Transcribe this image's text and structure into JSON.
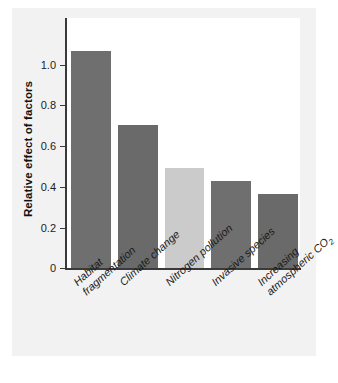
{
  "chart_data": {
    "type": "bar",
    "title": "",
    "xlabel": "",
    "ylabel": "Relative effect of factors",
    "categories": [
      "Habitat fragmentation",
      "Climate change",
      "Nitrogen pollution",
      "Invasive species",
      "Increasing atmospheric CO2"
    ],
    "values": [
      1.0,
      0.66,
      0.46,
      0.4,
      0.34
    ],
    "ylim": [
      0,
      1.15
    ],
    "yticks": [
      0,
      0.2,
      0.4,
      0.6,
      0.8,
      1.0
    ],
    "ytick_labels": [
      "0",
      "0.2",
      "0.4",
      "0.6",
      "0.8",
      "1.0"
    ],
    "grid": false,
    "legend": "none",
    "bar_colors": [
      "#6f6f6f",
      "#6a6a6a",
      "#cbcbcb",
      "#6f6f6f",
      "#6a6a6a"
    ]
  },
  "axes": {
    "y_title": "Relative effect of factors",
    "ticks": [
      {
        "label": "1.0",
        "value": 1.0
      },
      {
        "label": "0.8",
        "value": 0.8
      },
      {
        "label": "0.6",
        "value": 0.6
      },
      {
        "label": "0.4",
        "value": 0.4
      },
      {
        "label": "0.2",
        "value": 0.2
      },
      {
        "label": "0",
        "value": 0
      }
    ]
  },
  "bars": [
    {
      "line1": "Habitat",
      "line2": "fragmentation",
      "value": 1.0,
      "color": "#6f6f6f"
    },
    {
      "line1": "Climate change",
      "line2": "",
      "value": 0.66,
      "color": "#6a6a6a"
    },
    {
      "line1": "Nitrogen pollution",
      "line2": "",
      "value": 0.46,
      "color": "#cbcbcb"
    },
    {
      "line1": "Invasive species",
      "line2": "",
      "value": 0.4,
      "color": "#6f6f6f"
    },
    {
      "line1": "Increasing",
      "line2": "atmospheric CO",
      "line2_sub": "2",
      "value": 0.34,
      "color": "#6a6a6a"
    }
  ],
  "colors": {
    "figure_background": "#ffffff",
    "panel_background": "#f2f2f2",
    "plot_background": "#ffffff",
    "axis": "#3a3a3a",
    "text": "#1a1a1a"
  }
}
